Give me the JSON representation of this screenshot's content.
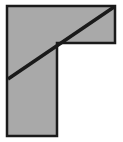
{
  "figure": {
    "canvas": {
      "width": 123,
      "height": 142,
      "background_color": "#ffffff"
    },
    "shape": {
      "name": "l-shape",
      "description": "Gamma / L-shaped right-angle polygon",
      "fill_color": "#a9a9a9",
      "stroke_color": "#1a1a1a",
      "stroke_width": 2.5,
      "points": "7,6 115,6 115,43 57,43 57,136 7,136",
      "vertices": [
        {
          "label": "top-left",
          "x": 7,
          "y": 6
        },
        {
          "label": "top-right",
          "x": 115,
          "y": 6
        },
        {
          "label": "arm-bottom-right",
          "x": 115,
          "y": 43
        },
        {
          "label": "inner-corner",
          "x": 57,
          "y": 43
        },
        {
          "label": "stem-bottom-right",
          "x": 57,
          "y": 136
        },
        {
          "label": "stem-bottom-left",
          "x": 7,
          "y": 136
        }
      ]
    },
    "diagonal": {
      "name": "diagonal-line",
      "stroke_color": "#1a1a1a",
      "stroke_width": 3.5,
      "x1": 8,
      "y1": 79,
      "x2": 114,
      "y2": 7
    }
  }
}
